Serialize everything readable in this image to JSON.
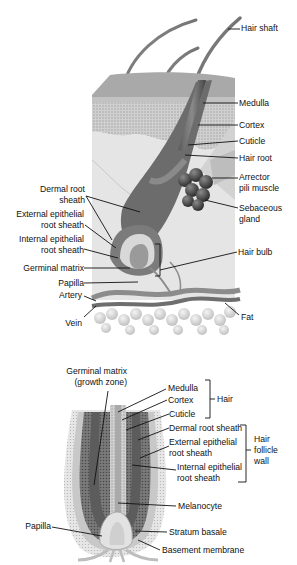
{
  "figures": [
    {
      "id": "hair-skin-section",
      "description": "Cross section of skin showing hair follicle anatomy",
      "labels_right": [
        {
          "text": "Hair shaft",
          "x": 241,
          "y": 23
        },
        {
          "text": "Medulla",
          "x": 239,
          "y": 98
        },
        {
          "text": "Cortex",
          "x": 239,
          "y": 121
        },
        {
          "text": "Cuticle",
          "x": 239,
          "y": 137
        },
        {
          "text": "Hair root",
          "x": 239,
          "y": 154
        },
        {
          "text": "Arrector",
          "x": 239,
          "y": 173
        },
        {
          "text": "pili muscle",
          "x": 239,
          "y": 184
        },
        {
          "text": "Sebaceous",
          "x": 239,
          "y": 204
        },
        {
          "text": "gland",
          "x": 239,
          "y": 215
        },
        {
          "text": "Hair bulb",
          "x": 238,
          "y": 248
        },
        {
          "text": "Fat",
          "x": 241,
          "y": 313
        }
      ],
      "labels_left": [
        {
          "text": "Dermal root",
          "y": 190
        },
        {
          "text": "sheath",
          "y": 201
        },
        {
          "text": "External epithelial",
          "y": 215
        },
        {
          "text": "root sheath",
          "y": 226
        },
        {
          "text": "Internal epithelial",
          "y": 240
        },
        {
          "text": "root sheath",
          "y": 251
        },
        {
          "text": "Germinal matrix",
          "y": 264
        },
        {
          "text": "Papilla",
          "y": 279
        },
        {
          "text": "Artery",
          "y": 292
        },
        {
          "text": "Vein",
          "y": 318
        }
      ]
    },
    {
      "id": "hair-follicle-detail",
      "description": "Longitudinal section of hair follicle",
      "top_label": {
        "line1": "Germinal matrix",
        "line2": "(growth zone)"
      },
      "labels_right": [
        {
          "text": "Medulla",
          "y": 383
        },
        {
          "text": "Cortex",
          "y": 395
        },
        {
          "text": "Cuticle",
          "y": 409
        },
        {
          "text": "Dermal root sheath",
          "y": 423
        },
        {
          "text": "External epithelial",
          "y": 437
        },
        {
          "text": "root sheath",
          "y": 448
        },
        {
          "text": "Internal epithelial",
          "y": 462
        },
        {
          "text": "root sheath",
          "y": 473
        },
        {
          "text": "Melanocyte",
          "y": 501
        },
        {
          "text": "Stratum basale",
          "y": 528
        },
        {
          "text": "Basement membrane",
          "y": 545
        }
      ],
      "group_labels": [
        {
          "text": "Hair",
          "y": 395
        },
        {
          "text": "Hair",
          "y": 435
        },
        {
          "text": "follicle",
          "y": 446
        },
        {
          "text": "wall",
          "y": 457
        }
      ],
      "labels_left": [
        {
          "text": "Papilla",
          "y": 522
        }
      ]
    }
  ]
}
